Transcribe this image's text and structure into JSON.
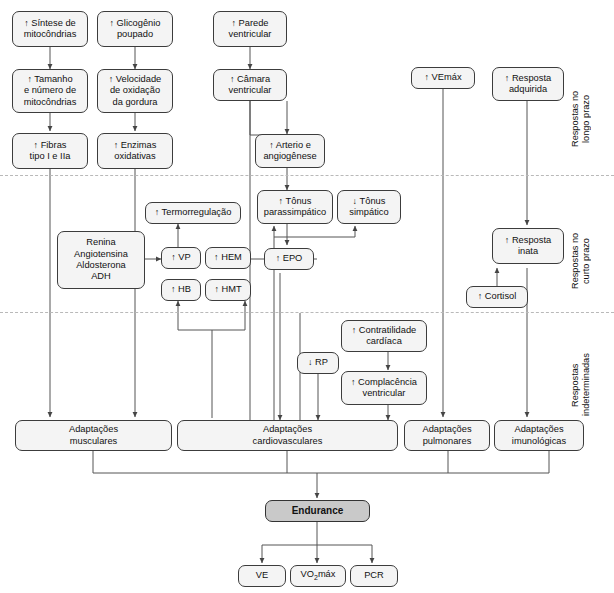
{
  "diagram": {
    "zones": [
      {
        "id": "longo",
        "label": "Respostas no\nlongo prazo"
      },
      {
        "id": "curto",
        "label": "Respostas no\ncurto prazo"
      },
      {
        "id": "indet",
        "label": "Respostas\nindeterminadas"
      }
    ],
    "nodes": [
      {
        "id": "sintese",
        "arrow": "↑",
        "label": "Síntese de\nmitocôndrias"
      },
      {
        "id": "tamanho",
        "arrow": "↑",
        "label": "Tamanho\ne número de\nmitocôndrias"
      },
      {
        "id": "fibras",
        "arrow": "↑",
        "label": "Fibras\ntipo I e IIa"
      },
      {
        "id": "glicogenio",
        "arrow": "↑",
        "label": "Glicogênio\npoupado"
      },
      {
        "id": "velocidade",
        "arrow": "↑",
        "label": "Velocidade\nde oxidação\nda gordura"
      },
      {
        "id": "enzimas",
        "arrow": "↑",
        "label": "Enzimas\noxidativas"
      },
      {
        "id": "parede",
        "arrow": "↑",
        "label": "Parede\nventricular"
      },
      {
        "id": "camara",
        "arrow": "↑",
        "label": "Câmara\nventricular"
      },
      {
        "id": "arterio",
        "arrow": "↑",
        "label": "Arterio e\nangiogênese"
      },
      {
        "id": "vemax",
        "arrow": "↑",
        "label": "VEmáx"
      },
      {
        "id": "resp_adq",
        "arrow": "↑",
        "label": "Resposta\nadquirida"
      },
      {
        "id": "termo",
        "arrow": "↑",
        "label": "Termorregulação"
      },
      {
        "id": "renina",
        "arrow": "",
        "label": "Renina\nAngiotensina\nAldosterona\nADH"
      },
      {
        "id": "vp",
        "arrow": "↑",
        "label": "VP"
      },
      {
        "id": "hem",
        "arrow": "↑",
        "label": "HEM"
      },
      {
        "id": "hb",
        "arrow": "↑",
        "label": "HB"
      },
      {
        "id": "hmt",
        "arrow": "↑",
        "label": "HMT"
      },
      {
        "id": "tonus_para",
        "arrow": "↑",
        "label": "Tônus\nparassimpático"
      },
      {
        "id": "tonus_simp",
        "arrow": "↓",
        "label": "Tônus\nsimpático"
      },
      {
        "id": "epo",
        "arrow": "↑",
        "label": "EPO"
      },
      {
        "id": "resp_inata",
        "arrow": "↑",
        "label": "Resposta\ninata"
      },
      {
        "id": "cortisol",
        "arrow": "↑",
        "label": "Cortisol"
      },
      {
        "id": "rp",
        "arrow": "↓",
        "label": "RP"
      },
      {
        "id": "contratilidade",
        "arrow": "↑",
        "label": "Contratilidade\ncardíaca"
      },
      {
        "id": "complacencia",
        "arrow": "↑",
        "label": "Complacência\nventricular"
      },
      {
        "id": "adapt_musc",
        "arrow": "",
        "label": "Adaptações\nmusculares"
      },
      {
        "id": "adapt_cardio",
        "arrow": "",
        "label": "Adaptações\ncardiovasculares"
      },
      {
        "id": "adapt_pulm",
        "arrow": "",
        "label": "Adaptações\npulmonares"
      },
      {
        "id": "adapt_imuno",
        "arrow": "",
        "label": "Adaptações\nimunológicas"
      },
      {
        "id": "endurance",
        "arrow": "",
        "label": "Endurance"
      },
      {
        "id": "ve",
        "arrow": "",
        "label": "VE"
      },
      {
        "id": "vo2max",
        "arrow": "",
        "label": "VO2máx"
      },
      {
        "id": "pcr",
        "arrow": "",
        "label": "PCR"
      }
    ],
    "colors": {
      "box_fill": "#f4f4f4",
      "box_stroke": "#3c3c3c",
      "endurance_fill": "#c9c9c9",
      "line": "#555555",
      "divider": "#b9b9b9"
    }
  }
}
